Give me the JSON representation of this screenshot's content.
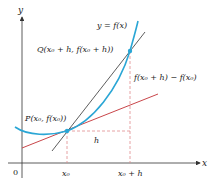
{
  "diagram": {
    "curve_label": "y = f(x)",
    "point_p_label": "P(x₀, f(x₀))",
    "point_q_label": "Q(x₀ + h, f(x₀ + h))",
    "rise_label": "f(x₀ + h) − f(x₀)",
    "run_label": "h",
    "axis_x_label": "x",
    "axis_y_label": "y",
    "origin_label": "0",
    "tick_x0_label": "x₀",
    "tick_x0h_label": "x₀ + h",
    "colors": {
      "curve": "#2aa6d5",
      "secant": "#333333",
      "tangent": "#c9464a",
      "dashed": "#e08a8e",
      "axis": "#333333",
      "point": "#2aa6d5"
    }
  }
}
